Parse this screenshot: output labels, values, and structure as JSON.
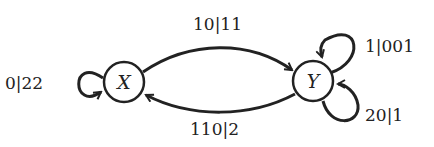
{
  "diagram": {
    "type": "state-machine",
    "nodes": [
      {
        "id": "X",
        "label": "X"
      },
      {
        "id": "Y",
        "label": "Y"
      }
    ],
    "edges": [
      {
        "from": "X",
        "to": "X",
        "label": "0|22"
      },
      {
        "from": "X",
        "to": "Y",
        "label": "10|11"
      },
      {
        "from": "Y",
        "to": "X",
        "label": "110|2"
      },
      {
        "from": "Y",
        "to": "Y",
        "label": "1|001"
      },
      {
        "from": "Y",
        "to": "Y",
        "label": "20|1"
      }
    ]
  }
}
